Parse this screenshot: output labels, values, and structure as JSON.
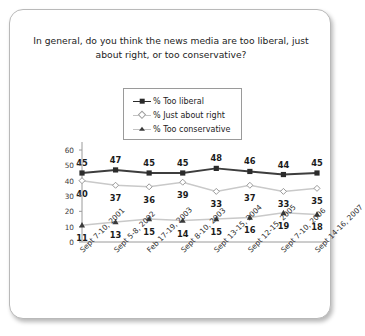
{
  "card": {
    "title": "In general, do you think the news media are too liberal, just about right, or too conservative?"
  },
  "legend": {
    "items": [
      {
        "label": "% Too liberal",
        "marker": "square-marker",
        "color": "#2b2b2b"
      },
      {
        "label": "% Just about right",
        "marker": "diamond-marker",
        "color": "#9d9d9d"
      },
      {
        "label": "% Too conservative",
        "marker": "triangle-marker",
        "color": "#3a3a3a"
      }
    ]
  },
  "chart_data": {
    "type": "line",
    "title": "In general, do you think the news media are too liberal, just about right, or too conservative?",
    "xlabel": "",
    "ylabel": "",
    "ylim": [
      0,
      60
    ],
    "yticks": [
      0,
      10,
      20,
      30,
      40,
      50,
      60
    ],
    "grid": false,
    "legend_position": "top-center",
    "categories": [
      "Sept 7-10, 2001",
      "Sept 5-8, 2002",
      "Feb 17-19, 2003",
      "Sept 8-10, 2003",
      "Sept 13-15, 2004",
      "Sept 12-15, 2005",
      "Sept 7-10, 2006",
      "Sept 14-16, 2007"
    ],
    "series": [
      {
        "name": "% Too liberal",
        "values": [
          45,
          47,
          45,
          45,
          48,
          46,
          44,
          45
        ]
      },
      {
        "name": "% Just about right",
        "values": [
          40,
          37,
          36,
          39,
          33,
          37,
          33,
          35
        ]
      },
      {
        "name": "% Too conservative",
        "values": [
          11,
          13,
          15,
          14,
          15,
          16,
          19,
          18
        ]
      }
    ]
  }
}
